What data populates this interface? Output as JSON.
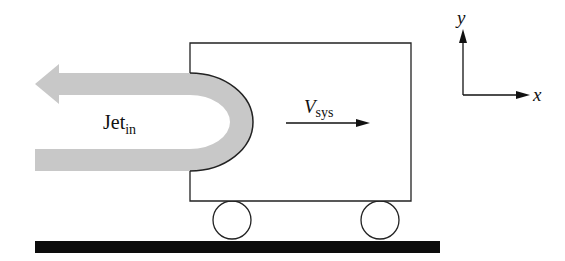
{
  "diagram": {
    "type": "jet-on-cart free-body schematic",
    "colors": {
      "jet": "#c8c8c8",
      "outline": "#222222",
      "ground": "#0c0c0c",
      "background": "#ffffff"
    },
    "labels": {
      "jet_main": "Jet",
      "jet_sub": "in",
      "velocity_main": "V",
      "velocity_sub": "sys",
      "axis_x": "x",
      "axis_y": "y"
    },
    "elements": {
      "cart_box": "rectangular cart body",
      "jet": "U-shaped jet reversing direction against cart",
      "wheels": [
        "left-wheel",
        "right-wheel"
      ],
      "ground": "ground surface",
      "velocity_arrow": "system velocity arrow pointing +x",
      "axes": "coordinate axes x (right) and y (up)"
    }
  }
}
